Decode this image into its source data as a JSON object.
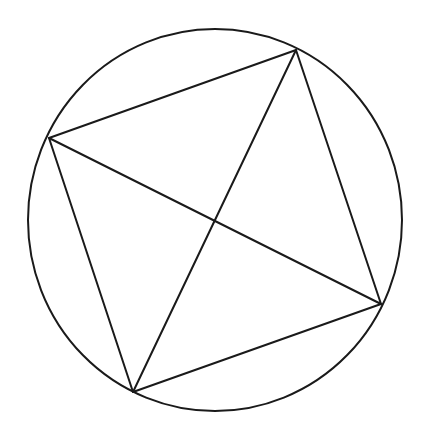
{
  "diagram": {
    "stroke_color": "#1a1a1a",
    "background": "#ffffff",
    "stroke_width": 2,
    "circle": {
      "cx": 215,
      "cy": 220,
      "rx": 187,
      "ry": 191
    },
    "vertices": [
      {
        "name": "top",
        "x": 296,
        "y": 50
      },
      {
        "name": "left",
        "x": 49,
        "y": 138
      },
      {
        "name": "bottom",
        "x": 133,
        "y": 392
      },
      {
        "name": "right",
        "x": 381,
        "y": 304
      }
    ],
    "diagonal_intersection": {
      "x": 214,
      "y": 220
    }
  }
}
